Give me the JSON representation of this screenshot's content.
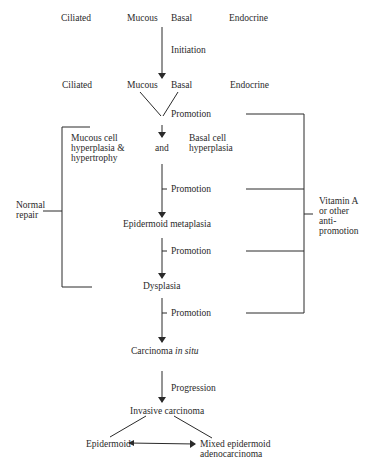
{
  "cells_row1": {
    "ciliated": "Ciliated",
    "mucous": "Mucous",
    "basal": "Basal",
    "endocrine": "Endocrine"
  },
  "initiation": "Initiation",
  "cells_row2": {
    "ciliated": "Ciliated",
    "mucous": "Mucous",
    "basal": "Basal",
    "endocrine": "Endocrine"
  },
  "promotion_labels": [
    "Promotion",
    "Promotion",
    "Promotion",
    "Promotion"
  ],
  "mucous_hyperplasia": "Mucous cell\nhyperplasia &\nhypertrophy",
  "and": "and",
  "basal_hyperplasia": "Basal cell\nhyperplasia",
  "normal_repair": "Normal\nrepair",
  "vitamin_a": "Vitamin A\nor other\nanti-\npromotion",
  "epidermoid_metaplasia": "Epidermoid metaplasia",
  "dysplasia": "Dysplasia",
  "carcinoma_prefix": "Carcinoma ",
  "carcinoma_italic": "in situ",
  "progression": "Progression",
  "invasive": "Invasive carcinoma",
  "epidermoid": "Epidermoid",
  "mixed": "Mixed epidermoid\nadenocarcinoma",
  "colors": {
    "ink": "#2a2a2a",
    "background": "#ffffff"
  }
}
